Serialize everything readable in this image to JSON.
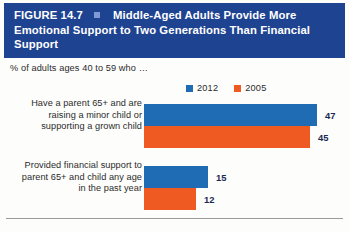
{
  "figure": {
    "number": "FIGURE 14.7",
    "separator_icon": "square-bullet-icon",
    "title": "Middle-Aged Adults Provide More Emotional Support to Two Generations Than Financial Support",
    "subtitle": "% of adults ages 40 to 59 who …"
  },
  "colors": {
    "header_background": "#1e4391",
    "header_text": "#ffffff",
    "separator": "#7f9ad6",
    "series_2012": "#1f6cb4",
    "series_2005": "#ef5a22",
    "value_text": "#1b2a52",
    "rule": "#9a9a9a"
  },
  "legend": {
    "position": "top-right",
    "items": [
      {
        "label": "2012",
        "color": "#1f6cb4"
      },
      {
        "label": "2005",
        "color": "#ef5a22"
      }
    ]
  },
  "chart_data": {
    "type": "bar",
    "orientation": "horizontal",
    "title": "Middle-Aged Adults Provide More Emotional Support to Two Generations Than Financial Support",
    "subtitle": "% of adults ages 40 to 59 who …",
    "xlabel": "",
    "ylabel": "",
    "xlim": [
      0,
      47
    ],
    "grid": false,
    "legend_position": "top-right",
    "categories": [
      "Have a parent 65+ and are raising a minor child or supporting a grown child",
      "Provided financial support to parent 65+ and child any age in the past year"
    ],
    "series": [
      {
        "name": "2012",
        "color": "#1f6cb4",
        "values": [
          47,
          15
        ]
      },
      {
        "name": "2005",
        "color": "#ef5a22",
        "values": [
          45,
          12
        ]
      }
    ]
  },
  "groups": [
    {
      "label": "Have a parent 65+ and are raising a minor child or supporting a grown child",
      "bars": [
        {
          "series": "2012",
          "value": 47,
          "value_text": "47",
          "color": "#1f6cb4",
          "width_px": 173
        },
        {
          "series": "2005",
          "value": 45,
          "value_text": "45",
          "color": "#ef5a22",
          "width_px": 166
        }
      ]
    },
    {
      "label": "Provided financial support to parent 65+ and child any age in the past year",
      "bars": [
        {
          "series": "2012",
          "value": 15,
          "value_text": "15",
          "color": "#1f6cb4",
          "width_px": 64
        },
        {
          "series": "2005",
          "value": 12,
          "value_text": "12",
          "color": "#ef5a22",
          "width_px": 52
        }
      ]
    }
  ]
}
